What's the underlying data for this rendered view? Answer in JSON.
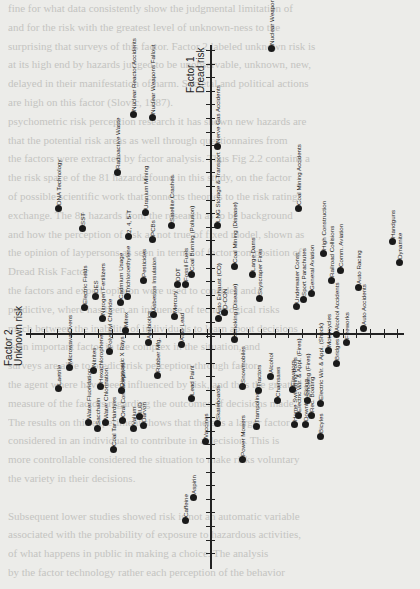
{
  "page": {
    "bleed_through_lines": [
      "fine for what data consistently show the judgmental limitation of",
      "and for the risk with the greatest level of unknown-ness to the",
      "surprising that surveys of this factor. Factor 2 labeled unknown risk is",
      "at its high end by hazards judged to be unobservable, unknown, new,",
      "delayed in their manifestation of harm. Societal and political actions",
      "are high on this factor (Slovic, 1987).",
      "psychometric risk perception research it has shown new hazards are",
      "that the potential risk areas as well through questionnaires from",
      "the factors were extracted by factor analysis. Thus Fig 2.2 contains a",
      "the risk space of the 81 hazards found in this study, on the factor",
      "of possible scientific work that connects theories to the risk rating",
      "exchange. The 81 hazards from the research as to be background",
      "and how the perception of risk as not true of fixed model, shown as",
      "the opinion of laypersons as seen in terms of factor composition of",
      "Dread Risk Factor",
      "the factors and expert opinion were used to consider and",
      "predictive, where has been an influence of technological risks",
      "much between the inability of individuals to learn about decisions",
      "is an important factor in the complex in the situation, and",
      "surveys are able to predict risk perception through factor.",
      "the agent where have been influenced by risk, and thus the greatest",
      "measure of the factors regarding the outcomes of decisions made.",
      "The results on this experiment shows that there is a larger factor",
      "considered in an individual to contribute in a decision. This is",
      "more controllable considered the situation to make risks voluntary",
      "the variety in their decisions.",
      "",
      "Subsequent lower studies showed risk is not an automatic variable",
      "associated with the probability of exposure to hazardous activities,",
      "of what happens in public in making a choice. The analysis",
      "by the factor technology rather each perception of the behavior"
    ]
  },
  "chart_data": {
    "type": "scatter",
    "title": "",
    "orientation_note": "figure rotated 90 degrees counter-clockwise on page",
    "xlabel": "Factor 1 Dread risk",
    "ylabel": "Factor 2 Unknown risk",
    "x_axis_label_line1": "Factor 1",
    "x_axis_label_line2": "Dread risk",
    "y_axis_label_line1": "Factor 2",
    "y_axis_label_line2": "Unknown risk",
    "grid": false,
    "points_pixel_space": [
      {
        "label": "DNA Technology",
        "px": 58,
        "py": 208
      },
      {
        "label": "SST",
        "px": 82,
        "py": 228
      },
      {
        "label": "Radioactive Waste",
        "px": 117,
        "py": 172
      },
      {
        "label": "Nuclear Reactor Accidents",
        "px": 133,
        "py": 114
      },
      {
        "label": "Nuclear Weapons Fallout",
        "px": 152,
        "py": 117
      },
      {
        "label": "Nerve Gas Accidents",
        "px": 217,
        "py": 146
      },
      {
        "label": "Nuclear Weapons (War)",
        "px": 271,
        "py": 48
      },
      {
        "label": "Uranium Mining",
        "px": 145,
        "py": 212
      },
      {
        "label": "2, 4, 5-T",
        "px": 128,
        "py": 236
      },
      {
        "label": "PCBs",
        "px": 152,
        "py": 239
      },
      {
        "label": "Satellite Crashes",
        "px": 171,
        "py": 225
      },
      {
        "label": "LNG Storage & Transport",
        "px": 217,
        "py": 225
      },
      {
        "label": "Coal Mining Accidents",
        "px": 298,
        "py": 208
      },
      {
        "label": "Electric Fields",
        "px": 84,
        "py": 307
      },
      {
        "label": "DES",
        "px": 95,
        "py": 296
      },
      {
        "label": "Nitrogen Fertilizers",
        "px": 102,
        "py": 318
      },
      {
        "label": "Cadmium Usage",
        "px": 120,
        "py": 302
      },
      {
        "label": "Trichloroethylene",
        "px": 127,
        "py": 296
      },
      {
        "label": "Pesticides",
        "px": 143,
        "py": 280
      },
      {
        "label": "Asbestos Insulation",
        "px": 153,
        "py": 314
      },
      {
        "label": "Mercury",
        "px": 174,
        "py": 316
      },
      {
        "label": "DDT",
        "px": 177,
        "py": 284
      },
      {
        "label": "Fossil Fuels",
        "px": 185,
        "py": 284
      },
      {
        "label": "Coal Burning (Pollution)",
        "px": 191,
        "py": 274
      },
      {
        "label": "Auto Exhaust (CO)",
        "px": 218,
        "py": 318
      },
      {
        "label": "D-CON",
        "px": 224,
        "py": 312
      },
      {
        "label": "Coal Mining (Disease)",
        "px": 234,
        "py": 266
      },
      {
        "label": "Large Dams",
        "px": 252,
        "py": 274
      },
      {
        "label": "Skyscraper Fires",
        "px": 259,
        "py": 298
      },
      {
        "label": "Underwater Const.",
        "px": 296,
        "py": 306
      },
      {
        "label": "Sport Parachutes",
        "px": 303,
        "py": 299
      },
      {
        "label": "General Aviation",
        "px": 311,
        "py": 293
      },
      {
        "label": "High Construction",
        "px": 323,
        "py": 253
      },
      {
        "label": "Railroad Collisions",
        "px": 331,
        "py": 280
      },
      {
        "label": "Comm. Aviation",
        "px": 340,
        "py": 270
      },
      {
        "label": "Alcohol Accidents",
        "px": 336,
        "py": 334
      },
      {
        "label": "Auto Racing",
        "px": 358,
        "py": 287
      },
      {
        "label": "Auto Accidents",
        "px": 363,
        "py": 328
      },
      {
        "label": "Handguns",
        "px": 392,
        "py": 241
      },
      {
        "label": "Dynamite",
        "px": 399,
        "py": 262
      },
      {
        "label": "Laetrile",
        "px": 58,
        "py": 388
      },
      {
        "label": "Microwave Ovens",
        "px": 69,
        "py": 367
      },
      {
        "label": "Nitrites",
        "px": 93,
        "py": 370
      },
      {
        "label": "Hexachlorophene",
        "px": 100,
        "py": 386
      },
      {
        "label": "Polyvinyl Chloride",
        "px": 109,
        "py": 351
      },
      {
        "label": "Diagnostic X Rays",
        "px": 121,
        "py": 390
      },
      {
        "label": "Mirex",
        "px": 125,
        "py": 330
      },
      {
        "label": "Antibiotics",
        "px": 148,
        "py": 342
      },
      {
        "label": "Rubber Mfg.",
        "px": 157,
        "py": 375
      },
      {
        "label": "Auto Lead",
        "px": 181,
        "py": 344
      },
      {
        "label": "Lead Paint",
        "px": 191,
        "py": 398
      },
      {
        "label": "IUD",
        "px": 139,
        "py": 416
      },
      {
        "label": "Valium",
        "px": 133,
        "py": 428
      },
      {
        "label": "Darvon",
        "px": 143,
        "py": 425
      },
      {
        "label": "Oral Contraceptives",
        "px": 122,
        "py": 420
      },
      {
        "label": "Water Fluoridation",
        "px": 88,
        "py": 422
      },
      {
        "label": "Saccharin",
        "px": 97,
        "py": 428
      },
      {
        "label": "Water Chlorination",
        "px": 105,
        "py": 422
      },
      {
        "label": "Coal Tar Hairdyes",
        "px": 113,
        "py": 449
      },
      {
        "label": "Vaccines",
        "px": 205,
        "py": 441
      },
      {
        "label": "Skateboards",
        "px": 217,
        "py": 423
      },
      {
        "label": "Smoking (Disease)",
        "px": 234,
        "py": 339
      },
      {
        "label": "Snowmobiles",
        "px": 242,
        "py": 386
      },
      {
        "label": "Trampolines",
        "px": 256,
        "py": 426
      },
      {
        "label": "Power Mowers",
        "px": 242,
        "py": 459
      },
      {
        "label": "Tractors",
        "px": 258,
        "py": 390
      },
      {
        "label": "Alcohol",
        "px": 270,
        "py": 376
      },
      {
        "label": "Chainsaws",
        "px": 277,
        "py": 400
      },
      {
        "label": "Elevators",
        "px": 292,
        "py": 389
      },
      {
        "label": "Electric Wir. & Appl. (Fires)",
        "px": 298,
        "py": 415
      },
      {
        "label": "Smoking (Fires)",
        "px": 307,
        "py": 400
      },
      {
        "label": "Home Swimming Pools",
        "px": 294,
        "py": 424
      },
      {
        "label": "Downhill Skiing",
        "px": 305,
        "py": 424
      },
      {
        "label": "Rec. Boating",
        "px": 311,
        "py": 415
      },
      {
        "label": "Electric Wir. & Appl. (Shock)",
        "px": 320,
        "py": 403
      },
      {
        "label": "Bicyles",
        "px": 320,
        "py": 436
      },
      {
        "label": "Motorcycles",
        "px": 328,
        "py": 350
      },
      {
        "label": "Bridges",
        "px": 336,
        "py": 363
      },
      {
        "label": "Fireworks",
        "px": 346,
        "py": 342
      },
      {
        "label": "Caffeine",
        "px": 185,
        "py": 520
      },
      {
        "label": "Aspirin",
        "px": 193,
        "py": 497
      }
    ]
  }
}
